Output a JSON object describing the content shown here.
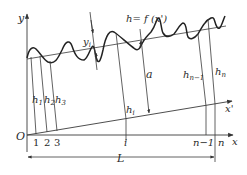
{
  "diagram": {
    "type": "surface-profile-measurement",
    "colors": {
      "line": "#3a3a3a",
      "curve": "#222222",
      "text": "#2a2a2a",
      "background": "#ffffff"
    },
    "labels": {
      "y_axis": "y",
      "x_axis": "x",
      "x_prime_axis": "x'",
      "origin": "O",
      "function": "h= f (x')",
      "yi": "y",
      "yi_sub": "i",
      "a": "a",
      "length": "L",
      "h1": "h",
      "h1_sub": "1",
      "h2": "h",
      "h2_sub": "2",
      "h3": "h",
      "h3_sub": "3",
      "hi": "h",
      "hi_sub": "i",
      "hn1": "h",
      "hn1_sub": "n−1",
      "hn": "h",
      "hn_sub": "n"
    },
    "ticks": [
      "1",
      "2",
      "3",
      "i",
      "n−1",
      "n"
    ]
  }
}
